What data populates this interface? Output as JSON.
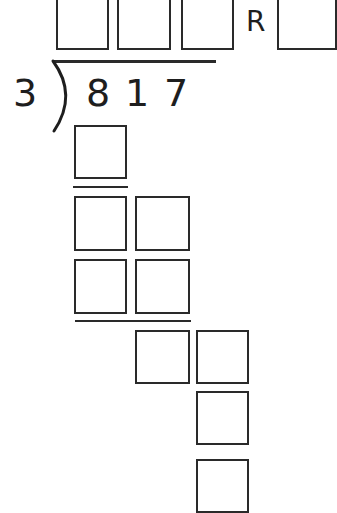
{
  "problem": {
    "divisor": "3",
    "dividend_digits": [
      "8",
      "1",
      "7"
    ],
    "remainder_label": "R"
  },
  "quotient_boxes": [
    {
      "id": "q1",
      "value": ""
    },
    {
      "id": "q2",
      "value": ""
    },
    {
      "id": "q3",
      "value": ""
    }
  ],
  "remainder_box": {
    "value": ""
  },
  "work_rows": [
    {
      "row": 1,
      "boxes": [
        ""
      ]
    },
    {
      "row": 2,
      "boxes": [
        "",
        ""
      ]
    },
    {
      "row": 3,
      "boxes": [
        "",
        ""
      ]
    },
    {
      "row": 4,
      "boxes": [
        "",
        ""
      ]
    },
    {
      "row": 5,
      "boxes": [
        ""
      ]
    },
    {
      "row": 6,
      "boxes": [
        ""
      ]
    }
  ]
}
